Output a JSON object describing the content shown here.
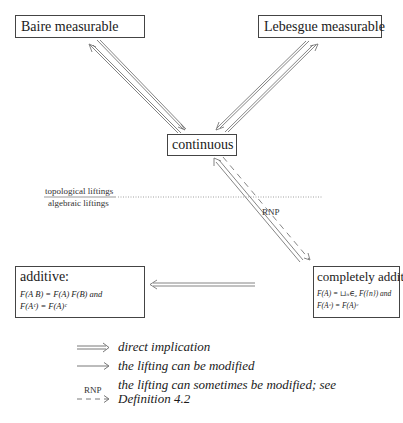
{
  "nodes": {
    "baire": {
      "label": "Baire measurable"
    },
    "lebesgue": {
      "label": "Lebesgue measurable"
    },
    "continuous": {
      "label": "continuous"
    },
    "additive": {
      "label": "additive:",
      "formula_line1": "F(A    B) = F(A)    F(B) and",
      "formula_line2": "F(Aᶜ) = F(A)ᶜ"
    },
    "completely_additive": {
      "label": "completely additive:",
      "formula_line1": "F(A) = ⊔ₙ∈ₐ F({n}) and",
      "formula_line2": "F(Aᶜ) = F(A)ᶜ"
    }
  },
  "divider": {
    "top_label": "topological liftings",
    "bottom_label": "algebraic liftings"
  },
  "edge_labels": {
    "rnp": "RNP"
  },
  "legend": {
    "items": [
      {
        "arrow": "double-arrow",
        "text": "direct implication"
      },
      {
        "arrow": "single-arrow",
        "text": "the lifting can be modified"
      },
      {
        "arrow": "dashed-arrow",
        "arrow_label": "RNP",
        "text_line1": "the lifting can sometimes be modified; see",
        "text_line2": "Definition 4.2"
      }
    ]
  },
  "colors": {
    "line": "#555555",
    "text": "#1a1a1a",
    "divider": "#888888"
  }
}
